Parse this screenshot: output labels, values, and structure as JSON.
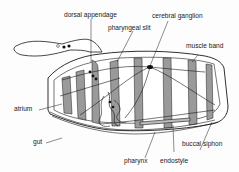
{
  "diagram": {
    "labels": {
      "dorsal_appendage": "dorsal appendage",
      "pharyngeal_slit": "pharyngeal slit",
      "cerebral_ganglion": "cerebral ganglion",
      "muscle_band": "muscle band",
      "atrium": "atrium",
      "gut": "gut",
      "buccal_siphon": "buccal siphon",
      "pharynx": "pharynx",
      "endostyle": "endostyle"
    },
    "colors": {
      "ink": "#1a1a1a",
      "muscle_band_fill": "#9a9a9a",
      "background": "#fdfdfd"
    }
  }
}
